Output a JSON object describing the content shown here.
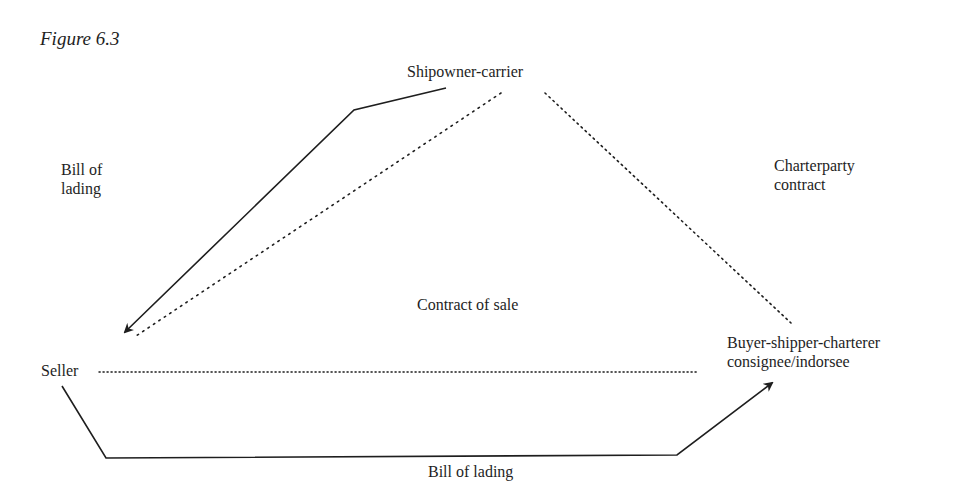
{
  "figure": {
    "title": "Figure 6.3"
  },
  "nodes": {
    "shipowner": {
      "label": "Shipowner-carrier"
    },
    "seller": {
      "label": "Seller"
    },
    "buyer": {
      "line1": "Buyer-shipper-charterer",
      "line2": "consignee/indorsee"
    }
  },
  "edge_labels": {
    "bill_of_lading_left": {
      "line1": "Bill of",
      "line2": "lading"
    },
    "charterparty": {
      "line1": "Charterparty",
      "line2": "contract"
    },
    "contract_of_sale": "Contract of sale",
    "bill_of_lading_bottom": "Bill of lading"
  },
  "edges": [
    {
      "from": "Shipowner-carrier",
      "to": "Seller",
      "style": "solid-arrow",
      "label": "Bill of lading"
    },
    {
      "from": "Shipowner-carrier",
      "to": "Seller",
      "style": "dotted",
      "label": ""
    },
    {
      "from": "Shipowner-carrier",
      "to": "Buyer-shipper-charterer",
      "style": "dotted",
      "label": "Charterparty contract"
    },
    {
      "from": "Seller",
      "to": "Buyer-shipper-charterer",
      "style": "dotted",
      "label": "Contract of sale"
    },
    {
      "from": "Seller",
      "to": "Buyer-shipper-charterer",
      "style": "solid-arrow",
      "label": "Bill of lading"
    }
  ],
  "colors": {
    "ink": "#1e1e1e",
    "background": "#ffffff"
  }
}
